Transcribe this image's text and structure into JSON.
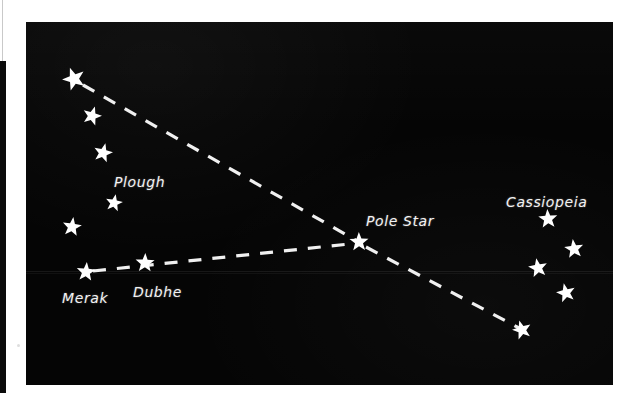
{
  "figure": {
    "kind": "star-chart",
    "background_color": "#050505",
    "page_color": "#ffffff",
    "star_color": "#ffffff",
    "line_color": "#f0f0f0",
    "plate": {
      "x": 26,
      "y": 22,
      "width": 587,
      "height": 363
    }
  },
  "labels": [
    {
      "name": "plough-label",
      "text": "Plough",
      "x": 114,
      "y": 182,
      "size": 14
    },
    {
      "name": "merak-label",
      "text": "Merak",
      "x": 62,
      "y": 298,
      "size": 14
    },
    {
      "name": "dubhe-label",
      "text": "Dubhe",
      "x": 133,
      "y": 292,
      "size": 14
    },
    {
      "name": "pole-star-label",
      "text": "Pole Star",
      "x": 366,
      "y": 221,
      "size": 14
    },
    {
      "name": "cassiopeia-label",
      "text": "Cassiopeia",
      "x": 506,
      "y": 202,
      "size": 14
    }
  ],
  "stars": [
    {
      "name": "star-plough-alkaid",
      "x": 74,
      "y": 79,
      "r": 12
    },
    {
      "name": "star-plough-mizar",
      "x": 92,
      "y": 116,
      "r": 10
    },
    {
      "name": "star-plough-alioth",
      "x": 103,
      "y": 153,
      "r": 10
    },
    {
      "name": "star-plough-megrez",
      "x": 114,
      "y": 203,
      "r": 9
    },
    {
      "name": "star-plough-phecda",
      "x": 72,
      "y": 227,
      "r": 10
    },
    {
      "name": "star-merak",
      "x": 86,
      "y": 272,
      "r": 10
    },
    {
      "name": "star-dubhe",
      "x": 145,
      "y": 263,
      "r": 10
    },
    {
      "name": "star-pole-star",
      "x": 359,
      "y": 242,
      "r": 10
    },
    {
      "name": "star-cassiopeia-1",
      "x": 548,
      "y": 219,
      "r": 10
    },
    {
      "name": "star-cassiopeia-2",
      "x": 574,
      "y": 249,
      "r": 10
    },
    {
      "name": "star-cassiopeia-3",
      "x": 538,
      "y": 268,
      "r": 10
    },
    {
      "name": "star-cassiopeia-4",
      "x": 566,
      "y": 293,
      "r": 10
    },
    {
      "name": "star-line-end",
      "x": 522,
      "y": 330,
      "r": 10
    }
  ],
  "pointer_lines": [
    {
      "name": "pointer-line-plough-to-pole-star",
      "x1": 83,
      "y1": 85,
      "x2": 359,
      "y2": 242
    },
    {
      "name": "pointer-line-merak-dubhe-to-pole-star",
      "x1": 93,
      "y1": 271,
      "x2": 359,
      "y2": 243
    },
    {
      "name": "pointer-line-pole-star-to-cassiopeia",
      "x1": 366,
      "y1": 247,
      "x2": 521,
      "y2": 329
    }
  ],
  "scanlines": [
    {
      "name": "scan-band-upper",
      "y": 249
    },
    {
      "name": "scan-band-lower",
      "y": 251
    }
  ]
}
